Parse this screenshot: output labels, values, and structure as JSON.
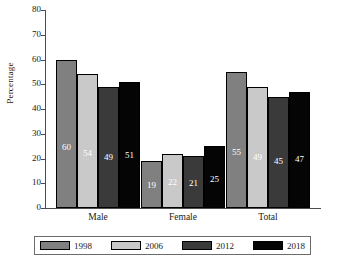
{
  "chart_data": {
    "type": "bar",
    "title": "",
    "xlabel": "",
    "ylabel": "Percentage",
    "ylim": [
      0,
      80
    ],
    "ytick_step": 10,
    "yticks": [
      0,
      10,
      20,
      30,
      40,
      50,
      60,
      70,
      80
    ],
    "grid": false,
    "legend_position": "bottom",
    "categories": [
      "Male",
      "Female",
      "Total"
    ],
    "series": [
      {
        "name": "1998",
        "color": "#808080",
        "values": [
          60,
          19,
          55
        ]
      },
      {
        "name": "2006",
        "color": "#c9c9c9",
        "values": [
          54,
          22,
          49
        ]
      },
      {
        "name": "2012",
        "color": "#3a3a3a",
        "values": [
          49,
          21,
          45
        ]
      },
      {
        "name": "2018",
        "color": "#050505",
        "values": [
          51,
          25,
          47
        ]
      }
    ],
    "value_labels": [
      [
        "60",
        "54",
        "49",
        "51"
      ],
      [
        "19",
        "22",
        "21",
        "25"
      ],
      [
        "55",
        "49",
        "45",
        "47"
      ]
    ]
  }
}
